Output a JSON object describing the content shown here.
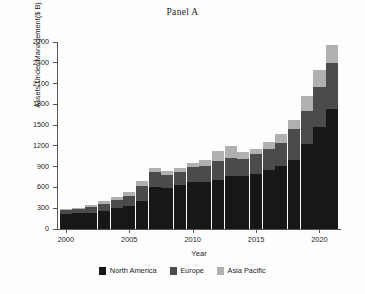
{
  "chart_data": {
    "type": "bar",
    "subtype": "stacked-vertical",
    "title": "Panel A",
    "xlabel": "Year",
    "ylabel": "Assets Under Management($ B)",
    "grid": false,
    "legend_position": "bottom",
    "ylim": [
      0,
      2700
    ],
    "yticks": [
      0,
      300,
      600,
      900,
      1200,
      1500,
      1800,
      2100,
      2400,
      2700
    ],
    "xticks": [
      2000,
      2005,
      2010,
      2015,
      2020
    ],
    "xlim": [
      1999.3,
      2021.7
    ],
    "categories": [
      2000,
      2001,
      2002,
      2003,
      2004,
      2005,
      2006,
      2007,
      2008,
      2009,
      2010,
      2011,
      2012,
      2013,
      2014,
      2015,
      2016,
      2017,
      2018,
      2019,
      2020,
      2021
    ],
    "series": [
      {
        "name": "North America",
        "color": "#171717",
        "values": [
          215,
          225,
          235,
          265,
          300,
          330,
          400,
          600,
          585,
          630,
          680,
          680,
          710,
          760,
          765,
          795,
          845,
          905,
          1000,
          1230,
          1480,
          1730
        ]
      },
      {
        "name": "Europe",
        "color": "#4b4b4b",
        "values": [
          55,
          60,
          85,
          100,
          115,
          150,
          220,
          225,
          200,
          200,
          210,
          230,
          270,
          260,
          250,
          285,
          310,
          340,
          450,
          470,
          575,
          660
        ]
      },
      {
        "name": "Asia Pacific",
        "color": "#b0b0b0",
        "values": [
          15,
          20,
          25,
          35,
          45,
          60,
          75,
          55,
          60,
          55,
          70,
          90,
          150,
          180,
          90,
          70,
          105,
          120,
          125,
          225,
          240,
          260
        ]
      }
    ],
    "totals": [
      285,
      305,
      345,
      400,
      460,
      540,
      695,
      880,
      845,
      885,
      960,
      1000,
      1130,
      1200,
      1105,
      1150,
      1260,
      1365,
      1575,
      1925,
      2295,
      2650
    ]
  }
}
